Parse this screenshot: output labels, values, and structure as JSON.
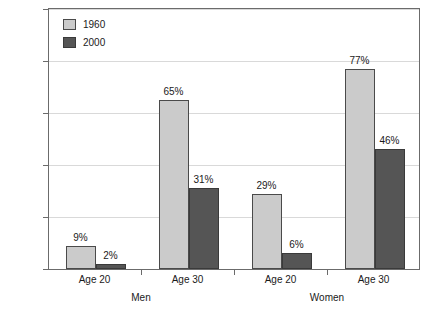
{
  "chart_data": {
    "type": "bar",
    "title": "",
    "xlabel": "",
    "ylabel": "",
    "ylim": [
      0,
      100
    ],
    "ytick_labels": [
      "0%",
      "20%",
      "40%",
      "60%",
      "80%",
      "100%"
    ],
    "ytick_values": [
      0,
      20,
      40,
      60,
      80,
      100
    ],
    "grid": true,
    "legend_position": "top-left-inside",
    "categories": [
      "Age 20",
      "Age 30",
      "Age 20",
      "Age 30"
    ],
    "group_labels": [
      "Men",
      "Women"
    ],
    "series": [
      {
        "name": "1960",
        "color": "#cbcbcb",
        "values": [
          9,
          65,
          29,
          77
        ],
        "value_labels": [
          "9%",
          "65%",
          "29%",
          "77%"
        ]
      },
      {
        "name": "2000",
        "color": "#555555",
        "values": [
          2,
          31,
          6,
          46
        ],
        "value_labels": [
          "2%",
          "31%",
          "6%",
          "46%"
        ]
      }
    ]
  },
  "legend": {
    "items": [
      {
        "label": "1960",
        "swatch": "legend-swatch-1960"
      },
      {
        "label": "2000",
        "swatch": "legend-swatch-2000"
      }
    ]
  },
  "axis": {
    "y_labels": [
      "100%",
      "80%",
      "60%",
      "40%",
      "20%",
      "0%"
    ],
    "x_category_labels": [
      "Age 20",
      "Age 30",
      "Age 20",
      "Age 30"
    ],
    "x_group_labels": [
      "Men",
      "Women"
    ]
  }
}
